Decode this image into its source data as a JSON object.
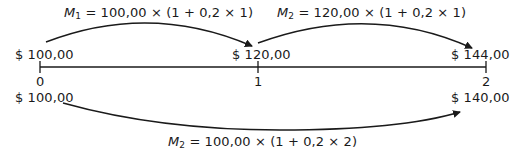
{
  "diagram": {
    "type": "cash-flow timeline (simple interest)",
    "timeline": {
      "ticks": [
        "0",
        "1",
        "2"
      ]
    },
    "top_values": [
      "$ 100,00",
      "$ 120,00",
      "$ 144,00"
    ],
    "bottom_values": [
      "$ 100,00",
      "$ 140,00"
    ],
    "formulas": {
      "top_left": {
        "var": "M",
        "sub": "1",
        "expr": " = 100,00 × (1 + 0,2 × 1)"
      },
      "top_right": {
        "var": "M",
        "sub": "2",
        "expr": " = 120,00 × (1 + 0,2 × 1)"
      },
      "bottom": {
        "var": "M",
        "sub": "2",
        "expr": " = 100,00 × (1 + 0,2 × 2)"
      }
    },
    "colors": {
      "line": "#1a1a1a",
      "text": "#1a1a1a",
      "background": "#ffffff"
    }
  }
}
